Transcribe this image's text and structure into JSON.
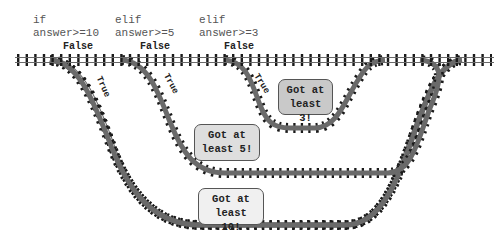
{
  "conditions": [
    {
      "keyword": "if",
      "expr": "answer>=10"
    },
    {
      "keyword": "elif",
      "expr": "answer>=5"
    },
    {
      "keyword": "elif",
      "expr": "answer>=3"
    }
  ],
  "branch_labels": {
    "false": [
      "False",
      "False",
      "False"
    ],
    "true": [
      "True",
      "True",
      "True"
    ]
  },
  "outcomes": [
    {
      "line1": "Got at",
      "line2": "least 3!",
      "fill": "#c9c9c9"
    },
    {
      "line1": "Got at",
      "line2": "least 5!",
      "fill": "#dedede"
    },
    {
      "line1": "Got at",
      "line2": "least 10!",
      "fill": "#f0f0f0"
    }
  ],
  "colors": {
    "rail": "#666666",
    "tie": "#1a1a1a",
    "box_border": "#555555"
  }
}
